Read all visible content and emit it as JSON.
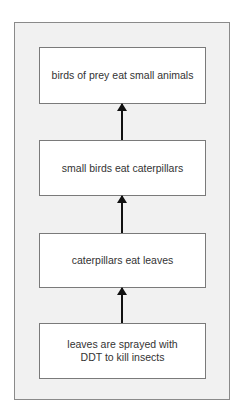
{
  "diagram": {
    "type": "food-chain flow",
    "direction": "bottom-to-top",
    "boxes": [
      {
        "id": "top",
        "text": "birds of prey eat small animals"
      },
      {
        "id": "second",
        "text": "small birds eat caterpillars"
      },
      {
        "id": "third",
        "text": "caterpillars eat leaves"
      },
      {
        "id": "bottom",
        "text": "leaves are sprayed with DDT to kill insects"
      }
    ],
    "arrows": [
      {
        "from": "bottom",
        "to": "third"
      },
      {
        "from": "third",
        "to": "second"
      },
      {
        "from": "second",
        "to": "top"
      }
    ],
    "colors": {
      "panel": "#f1f1f1",
      "box": "#ffffff",
      "border": "#7a7a7a",
      "arrow": "#111111",
      "text": "#333333"
    }
  }
}
